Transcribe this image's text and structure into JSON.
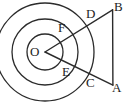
{
  "figure": {
    "type": "geometry-diagram",
    "stroke_color": "#2b2b2b",
    "background_color": "#ffffff",
    "center": {
      "label": "O",
      "x": 45,
      "y": 52
    },
    "circles": [
      {
        "name": "inner-circle",
        "radius": 18
      },
      {
        "name": "middle-circle",
        "radius": 33
      },
      {
        "name": "outer-circle",
        "radius": 49
      }
    ],
    "rays": [
      {
        "name": "ray-upper",
        "from": "O",
        "through": [
          "F",
          "D"
        ],
        "to": "B",
        "angle_deg": -32
      },
      {
        "name": "ray-lower",
        "from": "O",
        "through": [
          "E",
          "C"
        ],
        "to": "A",
        "angle_deg": 26
      }
    ],
    "chord": {
      "name": "segment-BA",
      "from": "B",
      "to": "A"
    },
    "points": [
      {
        "id": "O",
        "label": "O",
        "left": 30,
        "top": 45,
        "on": "center"
      },
      {
        "id": "F",
        "label": "F",
        "left": 58,
        "top": 21,
        "on": "inner-circle"
      },
      {
        "id": "D",
        "label": "D",
        "left": 86,
        "top": 7,
        "on": "middle-circle"
      },
      {
        "id": "B",
        "label": "B",
        "left": 114,
        "top": 0,
        "on": "outer-circle"
      },
      {
        "id": "E",
        "label": "E",
        "left": 62,
        "top": 65,
        "on": "inner-circle"
      },
      {
        "id": "C",
        "label": "C",
        "left": 86,
        "top": 76,
        "on": "middle-circle"
      },
      {
        "id": "A",
        "label": "A",
        "left": 112,
        "top": 81,
        "on": "outer-circle"
      }
    ]
  }
}
